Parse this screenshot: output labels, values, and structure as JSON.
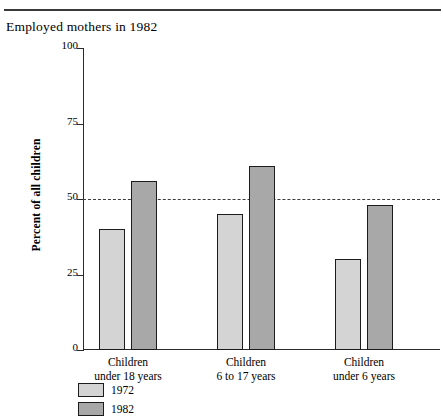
{
  "chart_data": {
    "type": "bar",
    "title": "Employed mothers in 1982",
    "xlabel": "",
    "ylabel": "Percent of all children",
    "ylim": [
      0,
      100
    ],
    "yticks": [
      0,
      25,
      50,
      75,
      100
    ],
    "ytick_labels": [
      "0",
      "25",
      "50",
      "75",
      "100"
    ],
    "grid": false,
    "legend_position": "bottom-left",
    "reference_line": {
      "value": 50,
      "style": "dashed"
    },
    "categories": [
      "Children\nunder 18 years",
      "Children\n6 to 17 years",
      "Children\nunder 6 years"
    ],
    "category_lines": [
      [
        "Children",
        "under 18 years"
      ],
      [
        "Children",
        "6 to 17 years"
      ],
      [
        "Children",
        "under 6 years"
      ]
    ],
    "series": [
      {
        "name": "1972",
        "values": [
          40,
          45,
          30
        ],
        "color": "#d4d4d4"
      },
      {
        "name": "1982",
        "values": [
          56,
          61,
          48
        ],
        "color": "#a8a8a8"
      }
    ]
  },
  "colors": {
    "axis": "#2b2b2b",
    "bar_outline": "#1c1c1c",
    "reference_line": "#3c3c3c",
    "rule": "#3a3a3a",
    "series_1972": "#d4d4d4",
    "series_1982": "#a8a8a8"
  }
}
